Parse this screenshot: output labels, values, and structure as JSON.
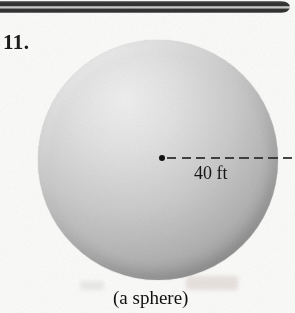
{
  "figure": {
    "problem_number": "11.",
    "radius_label": "40 ft",
    "caption": "(a sphere)"
  },
  "colors": {
    "paper": "#fbfbfa",
    "ink": "#1c1c1c",
    "rule_dark": "#323232",
    "rule_light": "#c9c9c9",
    "sphere_highlight": "#f0f0f0",
    "sphere_edge": "#8d8d8d"
  }
}
